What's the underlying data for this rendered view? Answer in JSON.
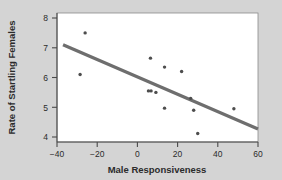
{
  "chart_data": {
    "type": "scatter",
    "title": "",
    "xlabel": "Male Responsiveness",
    "ylabel": "Rate of Startling Females",
    "xlim": [
      -40,
      60
    ],
    "ylim": [
      4,
      8
    ],
    "xticks": [
      -40,
      -20,
      0,
      20,
      40,
      60
    ],
    "xtick_labels": [
      "−40",
      "−20",
      "0",
      "20",
      "40",
      "60"
    ],
    "yticks": [
      4,
      5,
      6,
      7,
      8
    ],
    "ytick_labels": [
      "4",
      "5",
      "6",
      "7",
      "8"
    ],
    "grid": false,
    "legend": null,
    "points": [
      {
        "x": -26.0,
        "y": 7.5
      },
      {
        "x": -28.5,
        "y": 6.1
      },
      {
        "x": 6.5,
        "y": 6.65
      },
      {
        "x": 13.5,
        "y": 6.35
      },
      {
        "x": 22.0,
        "y": 6.2
      },
      {
        "x": 5.5,
        "y": 5.55
      },
      {
        "x": 6.8,
        "y": 5.55
      },
      {
        "x": 9.2,
        "y": 5.5
      },
      {
        "x": 13.5,
        "y": 4.97
      },
      {
        "x": 26.5,
        "y": 5.3
      },
      {
        "x": 28.0,
        "y": 4.9
      },
      {
        "x": 30.0,
        "y": 4.12
      },
      {
        "x": 48.0,
        "y": 4.95
      }
    ],
    "trend_line": {
      "name": "linear-fit",
      "x0": -37.0,
      "y0": 7.1,
      "x1": 60.0,
      "y1": 4.27,
      "color": "#6e6e6e"
    },
    "colors": {
      "background": "#d4d4d4",
      "plot_background": "#ffffff",
      "point": "#4d4d4d",
      "line": "#6e6e6e",
      "axis": "#4a4a4a",
      "text": "#2b2b2b"
    }
  }
}
